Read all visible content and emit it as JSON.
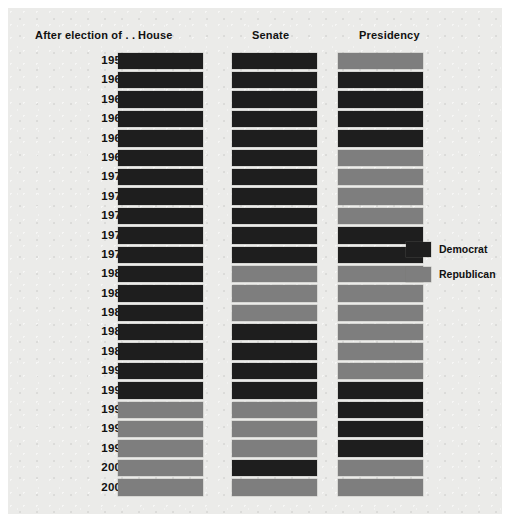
{
  "header": {
    "years_label": "After election of . . .",
    "columns": [
      {
        "key": "house",
        "label": "House"
      },
      {
        "key": "senate",
        "label": "Senate"
      },
      {
        "key": "pres",
        "label": "Presidency"
      }
    ]
  },
  "legend": {
    "items": [
      {
        "label": "Democrat",
        "party": "dem",
        "color": "#1e1e1e"
      },
      {
        "label": "Republican",
        "party": "rep",
        "color": "#7e7e7e"
      }
    ]
  },
  "chart_data": {
    "type": "heatmap",
    "title": "",
    "xlabel": "",
    "ylabel": "After election of . . .",
    "grid": false,
    "legend_position": "right",
    "categories": [
      "House",
      "Senate",
      "Presidency"
    ],
    "x": [
      "House",
      "Senate",
      "Presidency"
    ],
    "y": [
      "1958",
      "1960",
      "1962",
      "1964",
      "1966",
      "1968",
      "1970",
      "1972",
      "1974",
      "1976",
      "1978",
      "1980",
      "1982",
      "1984",
      "1986",
      "1988",
      "1990",
      "1992",
      "1994",
      "1996",
      "1998",
      "2000",
      "2002"
    ],
    "value_labels": {
      "dem": "Democrat",
      "rep": "Republican"
    },
    "colors": {
      "dem": "#1e1e1e",
      "rep": "#7e7e7e"
    },
    "rows": [
      {
        "year": "1958",
        "house": "dem",
        "senate": "dem",
        "pres": "rep"
      },
      {
        "year": "1960",
        "house": "dem",
        "senate": "dem",
        "pres": "dem"
      },
      {
        "year": "1962",
        "house": "dem",
        "senate": "dem",
        "pres": "dem"
      },
      {
        "year": "1964",
        "house": "dem",
        "senate": "dem",
        "pres": "dem"
      },
      {
        "year": "1966",
        "house": "dem",
        "senate": "dem",
        "pres": "dem"
      },
      {
        "year": "1968",
        "house": "dem",
        "senate": "dem",
        "pres": "rep"
      },
      {
        "year": "1970",
        "house": "dem",
        "senate": "dem",
        "pres": "rep"
      },
      {
        "year": "1972",
        "house": "dem",
        "senate": "dem",
        "pres": "rep"
      },
      {
        "year": "1974",
        "house": "dem",
        "senate": "dem",
        "pres": "rep"
      },
      {
        "year": "1976",
        "house": "dem",
        "senate": "dem",
        "pres": "dem"
      },
      {
        "year": "1978",
        "house": "dem",
        "senate": "dem",
        "pres": "dem"
      },
      {
        "year": "1980",
        "house": "dem",
        "senate": "rep",
        "pres": "rep"
      },
      {
        "year": "1982",
        "house": "dem",
        "senate": "rep",
        "pres": "rep"
      },
      {
        "year": "1984",
        "house": "dem",
        "senate": "rep",
        "pres": "rep"
      },
      {
        "year": "1986",
        "house": "dem",
        "senate": "dem",
        "pres": "rep"
      },
      {
        "year": "1988",
        "house": "dem",
        "senate": "dem",
        "pres": "rep"
      },
      {
        "year": "1990",
        "house": "dem",
        "senate": "dem",
        "pres": "rep"
      },
      {
        "year": "1992",
        "house": "dem",
        "senate": "dem",
        "pres": "dem"
      },
      {
        "year": "1994",
        "house": "rep",
        "senate": "rep",
        "pres": "dem"
      },
      {
        "year": "1996",
        "house": "rep",
        "senate": "rep",
        "pres": "dem"
      },
      {
        "year": "1998",
        "house": "rep",
        "senate": "rep",
        "pres": "dem"
      },
      {
        "year": "2000",
        "house": "rep",
        "senate": "dem",
        "pres": "rep"
      },
      {
        "year": "2002",
        "house": "rep",
        "senate": "rep",
        "pres": "rep"
      }
    ]
  }
}
